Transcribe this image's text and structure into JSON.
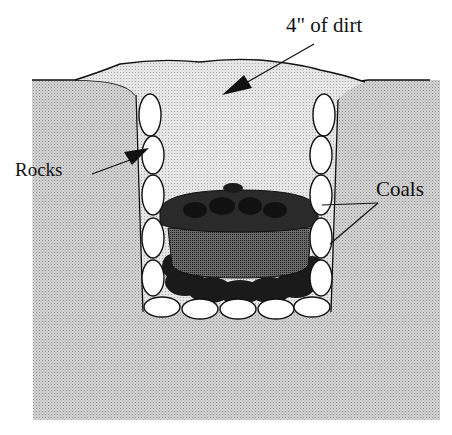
{
  "diagram": {
    "type": "cross-section",
    "labels": {
      "dirt": "4\" of dirt",
      "rocks": "Rocks",
      "coals": "Coals"
    },
    "components": [
      "ground",
      "dirt mound",
      "rock-lined pit",
      "dutch oven",
      "coals on lid",
      "coals beneath pot"
    ],
    "colors": {
      "ground": "#c4c4c4",
      "dirt_fill": "#dcdcdc",
      "rock": "#ffffff",
      "outline": "#111111",
      "coal": "#1a1a1a",
      "pot": "#555555"
    }
  }
}
